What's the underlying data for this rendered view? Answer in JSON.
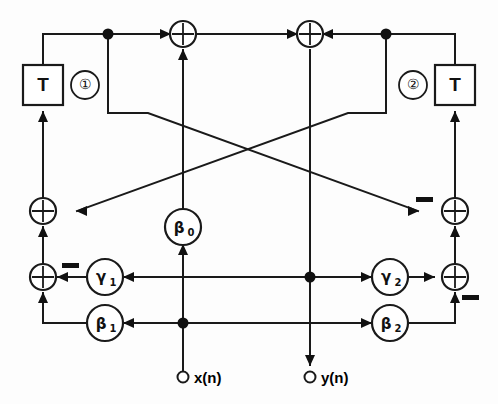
{
  "diagram": {
    "type": "signal-flow-graph",
    "canvas": {
      "width": 498,
      "height": 404
    },
    "colors": {
      "line": "#1a1a1a",
      "fill": "#ffffff",
      "background": "#fdfdfd",
      "dot": "#111111"
    },
    "delay_elements": [
      {
        "id": "delay-1",
        "label": "T",
        "index_label": "①",
        "index_side": "right",
        "x": 43,
        "y": 85
      },
      {
        "id": "delay-2",
        "label": "T",
        "index_label": "②",
        "index_side": "left",
        "x": 455,
        "y": 85
      }
    ],
    "adders": [
      {
        "id": "adder-top-left",
        "label": "+",
        "x": 183,
        "y": 34
      },
      {
        "id": "adder-top-right",
        "label": "+",
        "x": 310,
        "y": 34
      },
      {
        "id": "adder-left-upper",
        "label": "+",
        "x": 43,
        "y": 211
      },
      {
        "id": "adder-left-lower",
        "label": "+",
        "x": 43,
        "y": 277
      },
      {
        "id": "adder-right-upper",
        "label": "+",
        "x": 449,
        "y": 211
      },
      {
        "id": "adder-right-lower",
        "label": "+",
        "x": 449,
        "y": 277
      }
    ],
    "coefficients": [
      {
        "id": "coef-beta0",
        "symbol": "β",
        "subscript": "0",
        "x": 183,
        "y": 227
      },
      {
        "id": "coef-gamma1",
        "symbol": "γ",
        "subscript": "1",
        "x": 105,
        "y": 277
      },
      {
        "id": "coef-beta1",
        "symbol": "β",
        "subscript": "1",
        "x": 105,
        "y": 323
      },
      {
        "id": "coef-gamma2",
        "symbol": "γ",
        "subscript": "2",
        "x": 390,
        "y": 277
      },
      {
        "id": "coef-beta2",
        "symbol": "β",
        "subscript": "2",
        "x": 390,
        "y": 323
      }
    ],
    "minus_signs": [
      {
        "id": "minus-left-lower",
        "x": 70,
        "y": 266
      },
      {
        "id": "minus-right-upper",
        "x": 424,
        "y": 200
      },
      {
        "id": "minus-right-lower",
        "x": 470,
        "y": 297
      }
    ],
    "junction_dots": [
      {
        "id": "dot-top-left",
        "x": 108,
        "y": 34
      },
      {
        "id": "dot-top-right",
        "x": 386,
        "y": 34
      },
      {
        "id": "dot-input",
        "x": 183,
        "y": 323
      },
      {
        "id": "dot-output",
        "x": 310,
        "y": 277
      }
    ],
    "ports": [
      {
        "id": "port-input",
        "label": "x(n)",
        "x": 183,
        "y": 377,
        "direction": "in"
      },
      {
        "id": "port-output",
        "label": "y(n)",
        "x": 310,
        "y": 377,
        "direction": "out"
      }
    ]
  }
}
